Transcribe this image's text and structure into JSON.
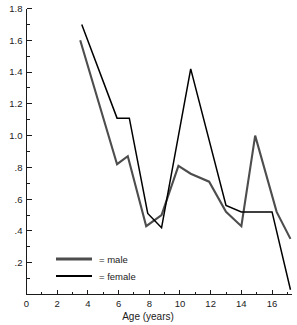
{
  "chart_data": {
    "type": "line",
    "title": "",
    "xlabel": "Age (years)",
    "ylabel": "",
    "xlim": [
      0,
      17.3
    ],
    "ylim": [
      0,
      1.8
    ],
    "grid": false,
    "legend_position": "bottom-left",
    "x_ticks_major": [
      0,
      2,
      4,
      6,
      8,
      10,
      12,
      14,
      16
    ],
    "x_tick_labels": [
      "0",
      "2",
      "4",
      "6",
      "8",
      "10",
      "12",
      "14",
      "16"
    ],
    "x_ticks_minor": [
      1,
      3,
      5,
      7,
      9,
      11,
      13,
      15,
      17
    ],
    "y_ticks_major": [
      0.2,
      0.4,
      0.6,
      0.8,
      1.0,
      1.2,
      1.4,
      1.6,
      1.8
    ],
    "y_tick_labels": [
      ".2",
      ".4",
      ".6",
      ".8",
      "1.0",
      "1.2",
      "1.4",
      "1.6",
      "1.8"
    ],
    "y_ticks_minor": [
      0.1,
      0.3,
      0.5,
      0.7,
      0.9,
      1.1,
      1.3,
      1.5,
      1.7
    ],
    "series": [
      {
        "name": "male",
        "color": "#4d4d4d",
        "points": [
          [
            3.5,
            1.6
          ],
          [
            5.9,
            0.82
          ],
          [
            6.6,
            0.87
          ],
          [
            7.8,
            0.43
          ],
          [
            8.8,
            0.5
          ],
          [
            9.9,
            0.81
          ],
          [
            10.7,
            0.76
          ],
          [
            11.9,
            0.71
          ],
          [
            13.0,
            0.52
          ],
          [
            14.0,
            0.43
          ],
          [
            14.9,
            1.0
          ],
          [
            16.3,
            0.52
          ],
          [
            17.2,
            0.35
          ]
        ]
      },
      {
        "name": "female",
        "color": "#000000",
        "points": [
          [
            3.6,
            1.7
          ],
          [
            5.9,
            1.11
          ],
          [
            6.7,
            1.11
          ],
          [
            7.9,
            0.51
          ],
          [
            8.8,
            0.42
          ],
          [
            10.7,
            1.42
          ],
          [
            13.0,
            0.56
          ],
          [
            14.0,
            0.52
          ],
          [
            16.0,
            0.52
          ],
          [
            17.2,
            0.03
          ]
        ]
      }
    ]
  },
  "legend": {
    "items": [
      {
        "label": "= male",
        "series": "male"
      },
      {
        "label": "= female",
        "series": "female"
      }
    ]
  },
  "axis": {
    "x_title": "Age (years)"
  },
  "colors": {
    "male": "#4d4d4d",
    "female": "#000000",
    "axis": "#1a1a1a",
    "background": "#ffffff"
  }
}
